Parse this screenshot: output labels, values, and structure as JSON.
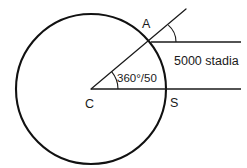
{
  "figure": {
    "background_color": "#ffffff",
    "stroke_color": "#111111",
    "text_color": "#1a1a1a",
    "labels": {
      "point_a": "A",
      "point_c": "C",
      "point_s": "S",
      "angle": "360°/50",
      "distance": "5000 stadia"
    },
    "geometry": {
      "circle": {
        "cx": 91,
        "cy": 89,
        "r": 75
      },
      "center_point": {
        "x": 91,
        "y": 89
      },
      "point_a": {
        "x": 154,
        "y": 42
      },
      "point_s": {
        "x": 166,
        "y": 89
      },
      "ray_start": {
        "x": 91,
        "y": 89
      },
      "ray_end": {
        "x": 186,
        "y": 9
      },
      "upper_line": {
        "x1": 154,
        "y1": 42,
        "x2": 241,
        "y2": 42
      },
      "lower_line": {
        "x1": 91,
        "y1": 89,
        "x2": 241,
        "y2": 89
      },
      "angle_arc_center_radius": 27,
      "angle_arc_a_radius": 22
    },
    "label_positions": {
      "point_a": {
        "x": 142,
        "y": 28
      },
      "point_c": {
        "x": 85,
        "y": 108
      },
      "point_s": {
        "x": 170,
        "y": 107
      },
      "angle": {
        "x": 117,
        "y": 82
      },
      "distance": {
        "x": 174,
        "y": 65
      }
    }
  }
}
